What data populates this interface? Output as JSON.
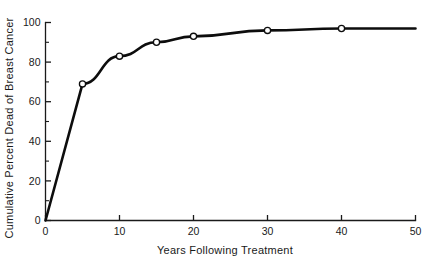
{
  "chart_data": {
    "type": "line",
    "title": "",
    "xlabel": "Years Following Treatment",
    "ylabel": "Cumulative Percent Dead of Breast Cancer",
    "xlim": [
      0,
      50
    ],
    "ylim": [
      0,
      100
    ],
    "grid": false,
    "legend": "none",
    "x_ticks_major": [
      0,
      10,
      20,
      30,
      40,
      50
    ],
    "x_tick_labels": [
      "0",
      "10",
      "20",
      "30",
      "40",
      "50"
    ],
    "x_ticks_minor": [
      5,
      15,
      25,
      35,
      45
    ],
    "y_ticks_major": [
      0,
      20,
      40,
      60,
      80,
      100
    ],
    "y_tick_labels": [
      "0",
      "20",
      "40",
      "60",
      "80",
      "100"
    ],
    "y_ticks_minor": [
      10,
      30,
      50,
      70,
      90
    ],
    "marker": "open-circle",
    "series": [
      {
        "name": "Cumulative percent dead of breast cancer",
        "x": [
          0,
          5,
          10,
          15,
          20,
          30,
          40,
          50
        ],
        "values": [
          0,
          69,
          83,
          90,
          93,
          96,
          97,
          97
        ],
        "marker_x": [
          5,
          10,
          15,
          20,
          30,
          40
        ],
        "marker_values": [
          69,
          83,
          90,
          93,
          96,
          97
        ]
      }
    ]
  },
  "axes": {
    "x_title": "Years Following Treatment",
    "y_title": "Cumulative Percent Dead of Breast Cancer"
  },
  "colors": {
    "line": "#0d0d0d",
    "axis": "#1a1a1a",
    "marker_fill": "#ffffff",
    "background": "#ffffff"
  }
}
